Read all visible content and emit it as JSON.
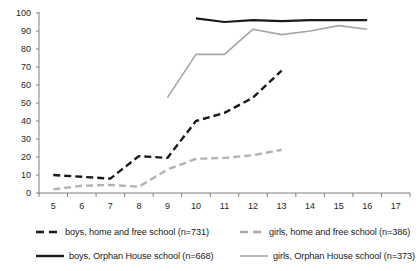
{
  "chart_data": {
    "type": "line",
    "title": "",
    "xlabel": "",
    "ylabel": "",
    "xlim": [
      4.5,
      17.5
    ],
    "ylim": [
      0,
      100
    ],
    "grid": false,
    "legend_position": "bottom",
    "x_ticks": [
      "5",
      "6",
      "7",
      "8",
      "9",
      "10",
      "11",
      "12",
      "13",
      "14",
      "15",
      "16",
      "17"
    ],
    "y_ticks": [
      "0",
      "10",
      "20",
      "30",
      "40",
      "50",
      "60",
      "70",
      "80",
      "90",
      "100"
    ],
    "series": [
      {
        "name": "boys, home and free school (n=731)",
        "style": "dashed",
        "color": "#1a1a1a",
        "x": [
          5,
          6,
          7,
          8,
          9,
          10,
          11,
          12,
          13
        ],
        "values": [
          10,
          9,
          8,
          20.5,
          19.5,
          40,
          44.5,
          53,
          68
        ]
      },
      {
        "name": "girls, home and free school (n=386)",
        "style": "dashed",
        "color": "#b3b3b3",
        "x": [
          5,
          6,
          7,
          8,
          9,
          10,
          11,
          12,
          13
        ],
        "values": [
          2,
          4,
          4.5,
          3.5,
          13,
          19,
          19.5,
          21,
          24
        ]
      },
      {
        "name": "boys, Orphan House school (n=668)",
        "style": "solid",
        "color": "#1a1a1a",
        "x": [
          10,
          11,
          12,
          13,
          14,
          15,
          16
        ],
        "values": [
          97,
          95,
          96,
          95.5,
          96,
          96,
          96
        ]
      },
      {
        "name": "girls, Orphan House school (n=373)",
        "style": "solid",
        "color": "#a6a6a6",
        "x": [
          9,
          10,
          11,
          12,
          13,
          14,
          15,
          16
        ],
        "values": [
          53,
          77,
          77,
          91,
          88,
          90,
          93,
          91
        ]
      }
    ]
  },
  "legend": {
    "rows": [
      [
        {
          "label": "boys, home and free school (n=731)",
          "swatch": "dashed-black"
        },
        {
          "label": "girls, home and free school (n=386)",
          "swatch": "dashed-grey"
        }
      ],
      [
        {
          "label": "boys, Orphan House school (n=668)",
          "swatch": "solid-black"
        },
        {
          "label": "girls, Orphan House school (n=373)",
          "swatch": "solid-grey"
        }
      ]
    ]
  },
  "colors": {
    "black": "#1a1a1a",
    "grey": "#a6a6a6",
    "grey_light": "#b3b3b3",
    "axis": "#7f7f7f"
  }
}
